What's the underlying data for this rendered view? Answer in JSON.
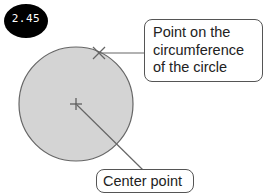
{
  "badge": {
    "value": "2.45",
    "bg_color": "#000000",
    "text_color": "#ffffff"
  },
  "circle": {
    "fill_color": "#d4d4d4",
    "stroke_color": "#666666",
    "cx": 76,
    "cy": 104,
    "r": 57
  },
  "markers": {
    "circumference_point": {
      "symbol": "x-mark",
      "x": 99,
      "y": 53
    },
    "center_point": {
      "symbol": "cross",
      "x": 76,
      "y": 104
    }
  },
  "callouts": {
    "circumference": {
      "lines": [
        "Point on the",
        "circumference",
        "of the circle"
      ]
    },
    "center": {
      "label": "Center point"
    }
  }
}
